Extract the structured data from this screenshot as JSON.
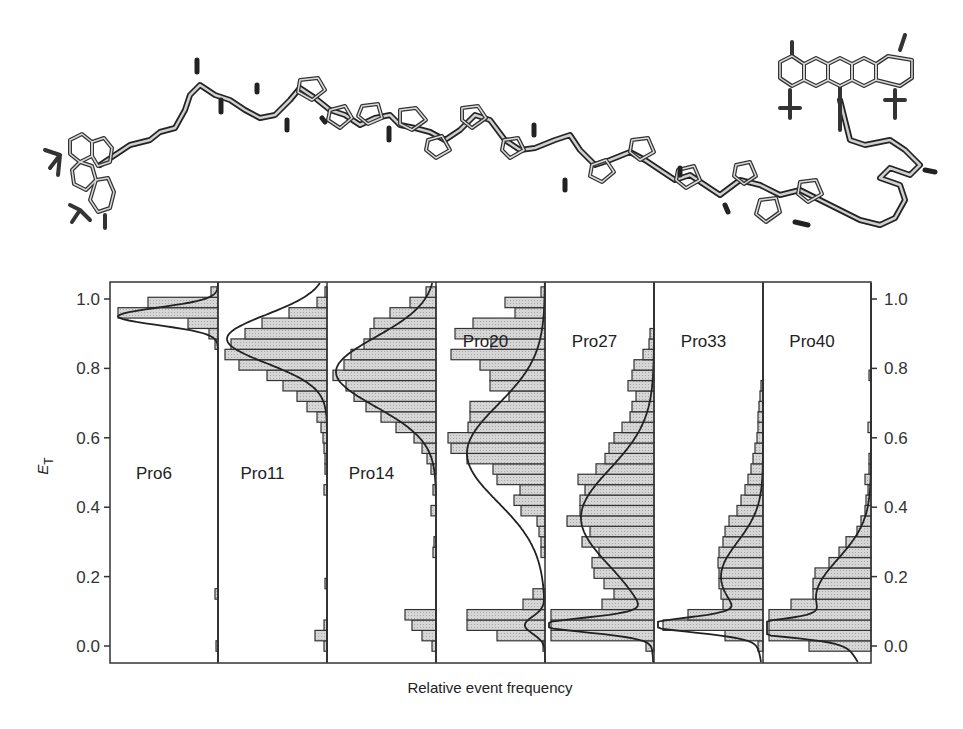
{
  "figure": {
    "molecule_caption": "",
    "molecule_description": "Stick model of polyproline peptide (Pro6–Pro40 series) labelled with Alexa 488 donor (left) and Alexa 594 acceptor (right)"
  },
  "chart_data": {
    "type": "bar",
    "orientation": "horizontal-histogram",
    "title": "",
    "xlabel": "Relative event frequency",
    "ylabel": "E_T",
    "ylabel_main": "E",
    "ylabel_sub": "T",
    "ylim": [
      -0.05,
      1.05
    ],
    "yticks": [
      0.0,
      0.2,
      0.4,
      0.6,
      0.8,
      1.0
    ],
    "ytick_labels": [
      "0.0",
      "0.2",
      "0.4",
      "0.6",
      "0.8",
      "1.0"
    ],
    "grid": false,
    "legend": null,
    "bin_width": 0.03,
    "bin_centers": [
      0.0,
      0.03,
      0.06,
      0.09,
      0.12,
      0.15,
      0.18,
      0.21,
      0.24,
      0.27,
      0.3,
      0.33,
      0.36,
      0.39,
      0.42,
      0.45,
      0.48,
      0.51,
      0.54,
      0.57,
      0.6,
      0.63,
      0.66,
      0.69,
      0.72,
      0.75,
      0.78,
      0.81,
      0.84,
      0.87,
      0.9,
      0.93,
      0.96,
      0.99,
      1.02
    ],
    "panels": [
      {
        "name": "Pro6",
        "label": "Pro6",
        "label_y": 0.5,
        "peak_E": 0.95,
        "fit": [
          {
            "mu": 0.95,
            "sigma": 0.025,
            "amp": 100
          }
        ],
        "values": [
          2,
          0,
          0,
          0,
          0,
          3,
          0,
          0,
          0,
          0,
          0,
          0,
          0,
          0,
          0,
          0,
          0,
          0,
          0,
          0,
          0,
          0,
          0,
          0,
          0,
          0,
          0,
          0,
          0,
          3,
          9,
          30,
          100,
          70,
          7
        ]
      },
      {
        "name": "Pro11",
        "label": "Pro11",
        "label_y": 0.5,
        "peak_E": 0.88,
        "fit": [
          {
            "mu": 0.885,
            "sigma": 0.07,
            "amp": 100
          }
        ],
        "values": [
          3,
          12,
          3,
          0,
          0,
          0,
          2,
          0,
          0,
          0,
          0,
          0,
          0,
          0,
          0,
          3,
          0,
          2,
          2,
          3,
          4,
          6,
          10,
          20,
          30,
          44,
          60,
          88,
          102,
          96,
          82,
          65,
          38,
          10,
          2
        ]
      },
      {
        "name": "Pro14",
        "label": "Pro14",
        "label_y": 0.5,
        "peak_E": 0.8,
        "fit": [
          {
            "mu": 0.79,
            "sigma": 0.1,
            "amp": 100
          }
        ],
        "values": [
          4,
          14,
          24,
          31,
          0,
          0,
          0,
          0,
          0,
          3,
          2,
          0,
          0,
          5,
          0,
          3,
          0,
          5,
          9,
          14,
          22,
          40,
          55,
          70,
          82,
          90,
          105,
          92,
          85,
          72,
          66,
          62,
          46,
          26,
          10
        ]
      },
      {
        "name": "Pro20",
        "label": "Pro20",
        "label_y": 0.88,
        "peak_E": 0.55,
        "fit": [
          {
            "mu": 0.555,
            "sigma": 0.14,
            "amp": 78
          },
          {
            "mu": 0.06,
            "sigma": 0.025,
            "amp": 20
          }
        ],
        "values": [
          2,
          48,
          78,
          78,
          22,
          12,
          0,
          0,
          0,
          4,
          4,
          6,
          8,
          24,
          31,
          25,
          48,
          52,
          78,
          94,
          97,
          77,
          75,
          75,
          36,
          55,
          55,
          65,
          94,
          54,
          90,
          72,
          30,
          40,
          4
        ]
      },
      {
        "name": "Pro27",
        "label": "Pro27",
        "label_y": 0.88,
        "peak_E": 0.35,
        "fit": [
          {
            "mu": 0.37,
            "sigma": 0.14,
            "amp": 73
          },
          {
            "mu": 0.06,
            "sigma": 0.02,
            "amp": 108
          }
        ],
        "values": [
          8,
          105,
          108,
          107,
          52,
          40,
          50,
          60,
          62,
          55,
          72,
          64,
          87,
          74,
          74,
          69,
          76,
          58,
          49,
          45,
          40,
          32,
          24,
          22,
          18,
          26,
          22,
          20,
          11,
          5,
          4,
          0,
          0,
          0,
          0
        ]
      },
      {
        "name": "Pro33",
        "label": "Pro33",
        "label_y": 0.88,
        "peak_E": 0.06,
        "fit": [
          {
            "mu": 0.06,
            "sigma": 0.02,
            "amp": 100
          },
          {
            "mu": 0.2,
            "sigma": 0.1,
            "amp": 42
          }
        ],
        "values": [
          5,
          38,
          100,
          75,
          40,
          42,
          44,
          44,
          45,
          44,
          40,
          38,
          34,
          26,
          22,
          18,
          15,
          12,
          10,
          8,
          6,
          5,
          5,
          4,
          3,
          2,
          0,
          0,
          0,
          0,
          0,
          0,
          0,
          0,
          0
        ]
      },
      {
        "name": "Pro40",
        "label": "Pro40",
        "label_y": 0.88,
        "peak_E": 0.05,
        "fit": [
          {
            "mu": 0.05,
            "sigma": 0.02,
            "amp": 110
          },
          {
            "mu": 0.14,
            "sigma": 0.11,
            "amp": 55
          }
        ],
        "values": [
          62,
          105,
          105,
          108,
          80,
          58,
          58,
          56,
          42,
          32,
          25,
          14,
          10,
          6,
          5,
          3,
          6,
          2,
          2,
          0,
          0,
          3,
          0,
          0,
          0,
          0,
          2,
          0,
          0,
          0,
          0,
          0,
          0,
          0,
          0
        ]
      }
    ]
  }
}
